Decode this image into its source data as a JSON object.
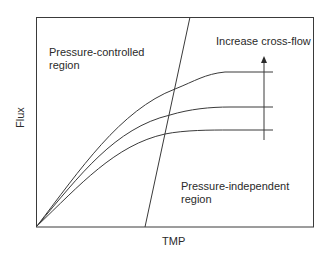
{
  "diagram": {
    "type": "flux-vs-tmp",
    "x_axis_label": "TMP",
    "y_axis_label": "Flux",
    "regions": [
      {
        "name": "pressure-controlled",
        "lines": [
          "Pressure-controlled",
          "region"
        ]
      },
      {
        "name": "pressure-independent",
        "lines": [
          "Pressure-independent",
          "region"
        ]
      }
    ],
    "annotation": "Increase cross-flow",
    "curves": [
      {
        "name": "low-cross-flow",
        "plateau_level": "low"
      },
      {
        "name": "medium-cross-flow",
        "plateau_level": "medium"
      },
      {
        "name": "high-cross-flow",
        "plateau_level": "high"
      }
    ],
    "colors": {
      "line": "#3a3a3a",
      "text": "#2a2a2a",
      "background": "#ffffff"
    }
  }
}
